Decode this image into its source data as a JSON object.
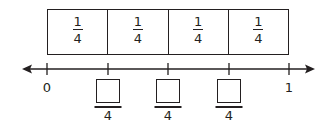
{
  "fraction_strip": {
    "cells": [
      {
        "numerator": "1",
        "denominator": "4"
      },
      {
        "numerator": "1",
        "denominator": "4"
      },
      {
        "numerator": "1",
        "denominator": "4"
      },
      {
        "numerator": "1",
        "denominator": "4"
      }
    ]
  },
  "number_line": {
    "start_label": "0",
    "end_label": "1",
    "blanks": [
      {
        "numerator": "",
        "denominator": "4"
      },
      {
        "numerator": "",
        "denominator": "4"
      },
      {
        "numerator": "",
        "denominator": "4"
      }
    ]
  },
  "colors": {
    "ink": "#231f20",
    "background": "#ffffff"
  }
}
